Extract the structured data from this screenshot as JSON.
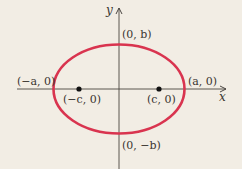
{
  "diagram": {
    "type": "ellipse-with-foci",
    "colors": {
      "background": "#f2ede4",
      "ellipse": "#d9344f",
      "axis": "#4a4540",
      "focus": "#111111",
      "text": "#3a3530"
    },
    "axes": {
      "x_label": "x",
      "y_label": "y"
    },
    "points": {
      "top_vertex": "(0, b)",
      "bottom_vertex": "(0, −b)",
      "left_vertex": "(−a, 0)",
      "right_vertex": "(a, 0)",
      "left_focus": "(−c, 0)",
      "right_focus": "(c, 0)"
    }
  }
}
